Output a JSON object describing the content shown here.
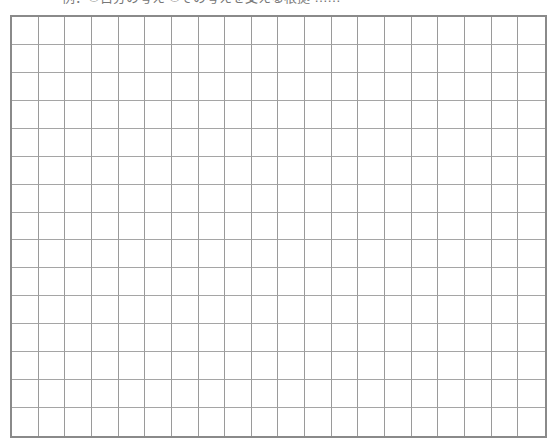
{
  "header": {
    "text": "例：①自分の考え ②その考えを支える根拠 ……"
  },
  "grid": {
    "columns": 20,
    "rows": 15,
    "line_color": "#9a9a9a",
    "border_color": "#8a8a8a"
  }
}
